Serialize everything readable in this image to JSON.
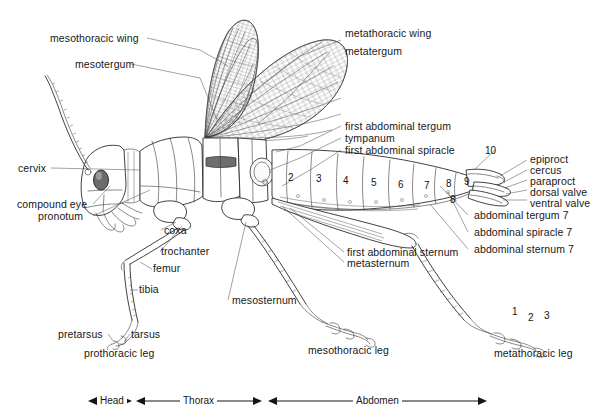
{
  "figure": {
    "background_color": "#ffffff",
    "line_color": "#2b2b2b",
    "text_color": "#171717"
  },
  "labels": {
    "mesothoracic_wing": "mesothoracic wing",
    "mesotergum": "mesotergum",
    "metathoracic_wing": "metathoracic wing",
    "metatergum": "metatergum",
    "first_abdominal_tergum": "first abdominal tergum",
    "tympanum": "tympanum",
    "first_abdominal_spiracle": "first abdominal spiracle",
    "cervix": "cervix",
    "compound_eye": "compound eye",
    "pronotum": "pronotum",
    "coxa": "coxa",
    "trochanter": "trochanter",
    "femur": "femur",
    "tibia": "tibia",
    "pretarsus": "pretarsus",
    "tarsus": "tarsus",
    "prothoracic_leg": "prothoracic leg",
    "mesosternum": "mesosternum",
    "mesothoracic_leg": "mesothoracic leg",
    "first_abdominal_sternum": "first abdominal sternum",
    "metasternum": "metasternum",
    "epiproct": "epiproct",
    "cercus": "cercus",
    "paraproct": "paraproct",
    "dorsal_valve": "dorsal valve",
    "ventral_valve": "ventral valve",
    "abdominal_tergum_7": "abdominal tergum 7",
    "abdominal_spiracle_7": "abdominal spiracle 7",
    "abdominal_sternum_7": "abdominal sternum 7",
    "metathoracic_leg": "metathoracic leg"
  },
  "abdominal_segment_numbers": [
    "2",
    "3",
    "4",
    "5",
    "6",
    "7",
    "8",
    "9",
    "10"
  ],
  "abdominal_sternum_number": "8",
  "tarsal_segment_numbers": [
    "1",
    "2",
    "3"
  ],
  "body_regions": [
    {
      "name": "Head"
    },
    {
      "name": "Thorax"
    },
    {
      "name": "Abdomen"
    }
  ]
}
